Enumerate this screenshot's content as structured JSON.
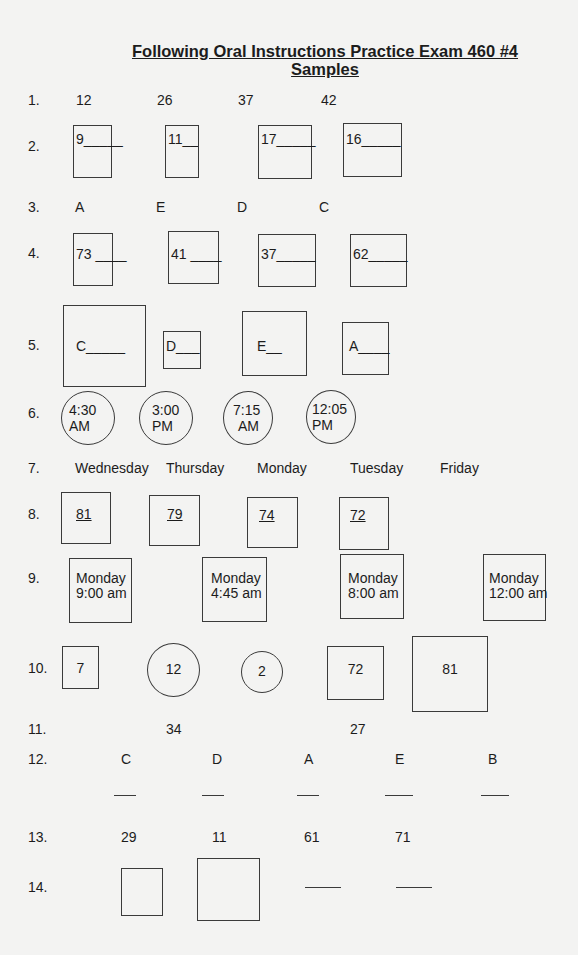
{
  "document": {
    "title": "Following Oral Instructions Practice Exam  460 #4",
    "subtitle": "Samples"
  },
  "rows": {
    "r1": {
      "label": "1.",
      "items": [
        "12",
        "26",
        "37",
        "42"
      ]
    },
    "r2": {
      "label": "2.",
      "items": [
        "9_____",
        "11_____",
        "17_____",
        "16_____"
      ]
    },
    "r3": {
      "label": "3.",
      "items": [
        "A",
        "E",
        "D",
        "C"
      ]
    },
    "r4": {
      "label": "4.",
      "items": [
        "73 ____",
        "41 ____",
        "37_____",
        "62_____"
      ]
    },
    "r5": {
      "label": "5.",
      "items": [
        "C_____",
        "D___",
        "E__",
        "A____"
      ]
    },
    "r6": {
      "label": "6.",
      "items": [
        {
          "time": "4:30",
          "period": "AM"
        },
        {
          "time": "3:00",
          "period": "PM"
        },
        {
          "time": "7:15",
          "period": "AM"
        },
        {
          "time": "12:05",
          "period": "PM"
        }
      ]
    },
    "r7": {
      "label": "7.",
      "items": [
        "Wednesday",
        "Thursday",
        "Monday",
        "Tuesday",
        "Friday"
      ]
    },
    "r8": {
      "label": "8.",
      "items": [
        "81",
        "79",
        "74",
        "72"
      ]
    },
    "r9": {
      "label": "9.",
      "items": [
        {
          "day": "Monday",
          "time": "9:00 am"
        },
        {
          "day": "Monday",
          "time": "4:45 am"
        },
        {
          "day": "Monday",
          "time": "8:00 am"
        },
        {
          "day": "Monday",
          "time": "12:00 am"
        }
      ]
    },
    "r10": {
      "label": "10.",
      "items": [
        "7",
        "12",
        "2",
        "72",
        "81"
      ]
    },
    "r11": {
      "label": "11.",
      "items": [
        "34",
        "27"
      ]
    },
    "r12": {
      "label": "12.",
      "items": [
        "C",
        "D",
        "A",
        "E",
        "B"
      ]
    },
    "r13": {
      "label": "13.",
      "items": [
        "29",
        "11",
        "61",
        "71"
      ]
    },
    "r14": {
      "label": "14."
    }
  }
}
